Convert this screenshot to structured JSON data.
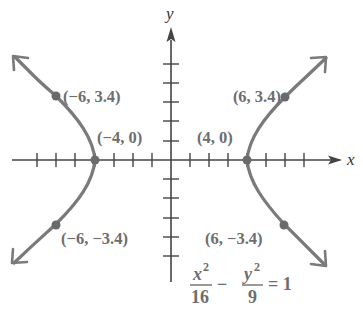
{
  "diagram": {
    "type": "hyperbola-graph",
    "axes": {
      "x_label": "x",
      "y_label": "y",
      "x_ticks": [
        -8,
        -7,
        -6,
        -5,
        -4,
        -3,
        -2,
        -1,
        1,
        2,
        3,
        4,
        5,
        6,
        7
      ],
      "y_ticks": [
        -5,
        -4,
        -3,
        -2,
        -1,
        1,
        2,
        3,
        4,
        5
      ]
    },
    "points": [
      {
        "id": "p1",
        "label": "(−6, 3.4)",
        "x": -6,
        "y": 3.4
      },
      {
        "id": "p2",
        "label": "(6, 3.4)",
        "x": 6,
        "y": 3.4
      },
      {
        "id": "p3",
        "label": "(−4, 0)",
        "x": -4,
        "y": 0
      },
      {
        "id": "p4",
        "label": "(4, 0)",
        "x": 4,
        "y": 0
      },
      {
        "id": "p5",
        "label": "(−6, −3.4)",
        "x": -6,
        "y": -3.4
      },
      {
        "id": "p6",
        "label": "(6, −3.4)",
        "x": 6,
        "y": -3.4
      }
    ],
    "equation": {
      "num1": "x",
      "exp1": "2",
      "den1": "16",
      "minus": "−",
      "num2": "y",
      "exp2": "2",
      "den2": "9",
      "rhs": "= 1"
    },
    "colors": {
      "curve": "#7a7a7a",
      "axes": "#444444",
      "text": "#6e6e6e",
      "point": "#6a6a6a"
    }
  }
}
